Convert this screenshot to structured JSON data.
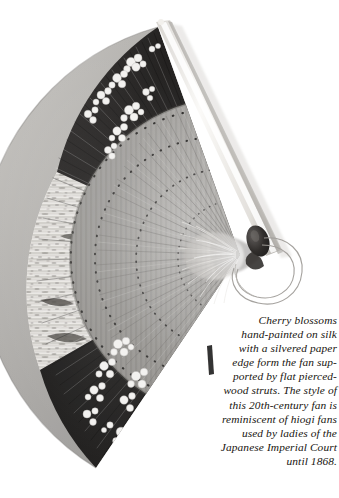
{
  "page": {
    "background_color": "#ffffff",
    "width": 339,
    "height": 498
  },
  "photo": {
    "subject": "japanese-folding-fan",
    "description": "Black and white photograph of an open Japanese folding fan with hand-painted cherry blossoms on silk, a silvered paper edge, flat pierced-wood struts, a dark rivet at the pivot and a thin cord loop.",
    "alt_text": "Open folding fan seen from the front, arc spanning upper-left to lower-left, pivot at right",
    "colors": {
      "background": "#ffffff",
      "silk_light": "#d8d6d2",
      "silk_mid": "#9c9a97",
      "silk_dark": "#6e6c6a",
      "band_dark": "#201e1d",
      "band_darker": "#141312",
      "paper_edge": "#efedea",
      "strut_grey": "#8f8d8b",
      "blossom_white": "#f4f3f1",
      "guard_stick": "#f3f1ed",
      "guard_shadow": "#b9b6b1",
      "rivet": "#2a2726",
      "cord": "#b3b0ac",
      "tassel": "#e6e4e1"
    },
    "parts": [
      {
        "name": "guard-stick",
        "label": "Guard stick"
      },
      {
        "name": "fan-leaf",
        "label": "Fan leaf"
      },
      {
        "name": "silvered-paper-edge",
        "label": "Silvered paper edge"
      },
      {
        "name": "cherry-blossoms",
        "label": "Cherry blossoms"
      },
      {
        "name": "pierced-wood-struts",
        "label": "Pierced wood struts"
      },
      {
        "name": "pivot-rivet",
        "label": "Pivot rivet"
      },
      {
        "name": "cord-loop",
        "label": "Cord loop"
      },
      {
        "name": "tassel",
        "label": "Tassel"
      }
    ]
  },
  "caption": {
    "text": "Cherry blossoms\nhand-painted on silk\nwith a silvered paper\nedge form the fan sup-\nported by flat pierced-\nwood struts. The style of\nthis 20th-century fan is\nreminiscent of hiogi fans\nused by ladies of the\nJapanese Imperial Court\nuntil 1868.",
    "lines": [
      "Cherry blossoms",
      "hand-painted on silk",
      "with a silvered paper",
      "edge form the fan sup-",
      "ported by flat pierced-",
      "wood struts. The style of",
      "this 20th-century fan is",
      "reminiscent of hiogi fans",
      "used by ladies of the",
      "Japanese Imperial Court",
      "until 1868."
    ],
    "color": "#17140f",
    "style": "italic"
  }
}
